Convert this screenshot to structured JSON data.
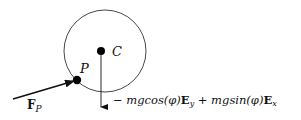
{
  "diagram": {
    "labels": {
      "center": "C",
      "contact_point": "P",
      "force_symbol": "F",
      "force_subscript": "P"
    },
    "equation": {
      "parts": [
        {
          "text": "− ",
          "style": "normal"
        },
        {
          "text": "mgcos(φ)",
          "style": "italic"
        },
        {
          "text": "E",
          "style": "bold"
        },
        {
          "text": "y",
          "style": "sub"
        },
        {
          "text": " + ",
          "style": "normal"
        },
        {
          "text": "mgsin(φ)",
          "style": "italic"
        },
        {
          "text": "E",
          "style": "bold"
        },
        {
          "text": "x",
          "style": "sub"
        }
      ],
      "p0": "− ",
      "p1": "mgcos(φ)",
      "p2": "E",
      "p3": "y",
      "p4": " + ",
      "p5": "mgsin(φ)",
      "p6": "E",
      "p7": "x"
    },
    "colors": {
      "stroke": "#111111",
      "background": "#ffffff"
    }
  }
}
